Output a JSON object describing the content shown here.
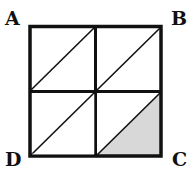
{
  "figure": {
    "labels": {
      "top_left": "A",
      "top_right": "B",
      "bottom_right": "C",
      "bottom_left": "D"
    },
    "grid": {
      "rows": 2,
      "cols": 2
    },
    "diagonals": "each small square has a diagonal from its bottom-left to top-right corner",
    "shaded_region": "lower-right triangle of the bottom-right small square",
    "colors": {
      "stroke": "#111111",
      "shade": "#d8d8d8",
      "background": "#ffffff"
    }
  }
}
